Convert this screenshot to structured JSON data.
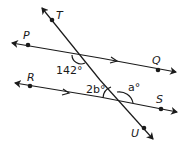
{
  "diagram": {
    "type": "parallel-lines-transversal",
    "points": {
      "T": "T",
      "P": "P",
      "Q": "Q",
      "R": "R",
      "S": "S",
      "U": "U"
    },
    "angles": {
      "angle_1": "142°",
      "angle_2": "2b°",
      "angle_3": "a°"
    },
    "colors": {
      "stroke": "#1a1a1a",
      "background": "#ffffff"
    }
  }
}
